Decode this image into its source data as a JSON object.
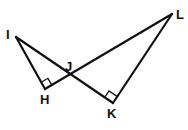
{
  "diagram": {
    "type": "geometry",
    "stroke_color": "#111111",
    "points": {
      "I": {
        "label": "I",
        "x": 16,
        "y": 37
      },
      "H": {
        "label": "H",
        "x": 45,
        "y": 89
      },
      "J": {
        "label": "J",
        "x": 70,
        "y": 75
      },
      "K": {
        "label": "K",
        "x": 113,
        "y": 103
      },
      "L": {
        "label": "L",
        "x": 172,
        "y": 14
      }
    },
    "segments": [
      "IH",
      "HL",
      "IK",
      "KL"
    ],
    "right_angles": [
      "H",
      "K"
    ],
    "intersection": "J"
  }
}
